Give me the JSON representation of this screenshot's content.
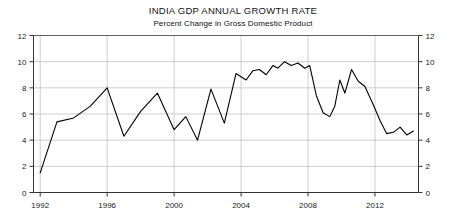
{
  "chart_data": {
    "type": "line",
    "title": "INDIA GDP ANNUAL GROWTH RATE",
    "subtitle": "Percent Change in Gross Domestic Product",
    "xlabel": "",
    "ylabel": "",
    "xlim": [
      1991.6,
      2014.6
    ],
    "ylim": [
      0,
      12
    ],
    "ytick_labels": [
      "0",
      "2",
      "4",
      "6",
      "8",
      "10",
      "12"
    ],
    "yticks": [
      0,
      2,
      4,
      6,
      8,
      10,
      12
    ],
    "xtick_labels": [
      "1992",
      "1996",
      "2000",
      "2004",
      "2008",
      "2012"
    ],
    "xticks": [
      1992,
      1996,
      2000,
      2004,
      2008,
      2012
    ],
    "grid": true,
    "legend": "none",
    "right_axis_labels": [
      "0",
      "2",
      "4",
      "6",
      "8",
      "10",
      "12"
    ],
    "series": [
      {
        "name": "India GDP Annual Growth Rate",
        "color": "#000000",
        "x": [
          1992.0,
          1993.0,
          1994.0,
          1995.0,
          1996.0,
          1997.0,
          1998.0,
          1999.0,
          2000.0,
          2000.7,
          2001.4,
          2002.2,
          2003.0,
          2003.7,
          2004.3,
          2004.7,
          2005.1,
          2005.5,
          2005.9,
          2006.2,
          2006.6,
          2007.0,
          2007.4,
          2007.8,
          2008.1,
          2008.5,
          2008.9,
          2009.3,
          2009.6,
          2009.9,
          2010.2,
          2010.6,
          2011.0,
          2011.4,
          2011.9,
          2012.3,
          2012.7,
          2013.1,
          2013.5,
          2013.9,
          2014.3
        ],
        "values": [
          1.5,
          5.4,
          5.7,
          6.6,
          8.0,
          4.3,
          6.2,
          7.6,
          4.8,
          5.8,
          4.0,
          7.9,
          5.3,
          9.1,
          8.6,
          9.3,
          9.4,
          9.0,
          9.7,
          9.5,
          10.0,
          9.7,
          9.9,
          9.5,
          9.7,
          7.4,
          6.1,
          5.8,
          6.6,
          8.6,
          7.6,
          9.4,
          8.5,
          8.1,
          6.7,
          5.5,
          4.5,
          4.6,
          5.0,
          4.4,
          4.7
        ]
      }
    ]
  }
}
